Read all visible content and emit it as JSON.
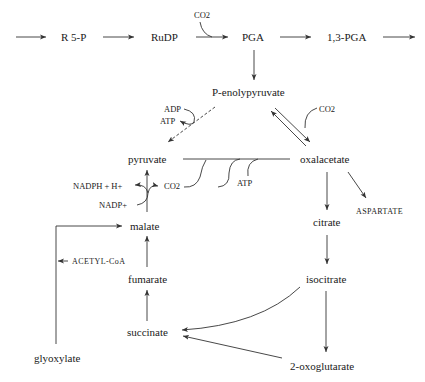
{
  "diagram": {
    "type": "metabolic-pathway",
    "top_row": {
      "nodes": [
        "R 5-P",
        "RuDP",
        "PGA",
        "1,3-PGA"
      ],
      "cofactor_into_pga": "CO2"
    },
    "nodes": {
      "r5p": "R 5-P",
      "rudp": "RuDP",
      "pga": "PGA",
      "pga13": "1,3-PGA",
      "pep": "P-enolypyruvate",
      "pyruvate": "pyruvate",
      "oxalacetate": "oxalacetate",
      "malate": "malate",
      "fumarate": "fumarate",
      "succinate": "succinate",
      "glyoxylate": "glyoxylate",
      "citrate": "citrate",
      "isocitrate": "isocitrate",
      "oxoglutarate": "2-oxoglutarate",
      "aspartate": "ASPARTATE"
    },
    "cofactors": {
      "co2_rudp": "CO2",
      "adp": "ADP",
      "atp_pep": "ATP",
      "co2_pep": "CO2",
      "nadph": "NADPH + H+",
      "nadp": "NADP+",
      "co2_malic": "CO2",
      "atp_pyr": "ATP",
      "acetyl_coa": "ACETYL-CoA"
    },
    "edges": [
      {
        "from": "start",
        "to": "R 5-P"
      },
      {
        "from": "R 5-P",
        "to": "RuDP"
      },
      {
        "from": "RuDP",
        "to": "PGA",
        "cofactor_in": "CO2"
      },
      {
        "from": "PGA",
        "to": "1,3-PGA"
      },
      {
        "from": "1,3-PGA",
        "to": "continue"
      },
      {
        "from": "PGA",
        "to": "P-enolypyruvate"
      },
      {
        "from": "P-enolypyruvate",
        "to": "pyruvate",
        "style": "dashed",
        "cofactors": [
          "ADP",
          "ATP"
        ]
      },
      {
        "from": "P-enolypyruvate",
        "to": "oxalacetate",
        "style": "reversible",
        "cofactor_in": "CO2"
      },
      {
        "from": "pyruvate",
        "to": "oxalacetate",
        "cofactors_in": [
          "CO2",
          "ATP"
        ]
      },
      {
        "from": "malate",
        "to": "pyruvate",
        "cofactors": [
          "NADP+",
          "NADPH + H+",
          "CO2"
        ]
      },
      {
        "from": "oxalacetate",
        "to": "citrate"
      },
      {
        "from": "oxalacetate",
        "to": "ASPARTATE"
      },
      {
        "from": "citrate",
        "to": "isocitrate"
      },
      {
        "from": "isocitrate",
        "to": "2-oxoglutarate"
      },
      {
        "from": "isocitrate",
        "to": "succinate"
      },
      {
        "from": "2-oxoglutarate",
        "to": "succinate"
      },
      {
        "from": "succinate",
        "to": "fumarate"
      },
      {
        "from": "fumarate",
        "to": "malate"
      },
      {
        "from": "glyoxylate",
        "to": "malate",
        "cofactor_in": "ACETYL-CoA"
      }
    ]
  }
}
